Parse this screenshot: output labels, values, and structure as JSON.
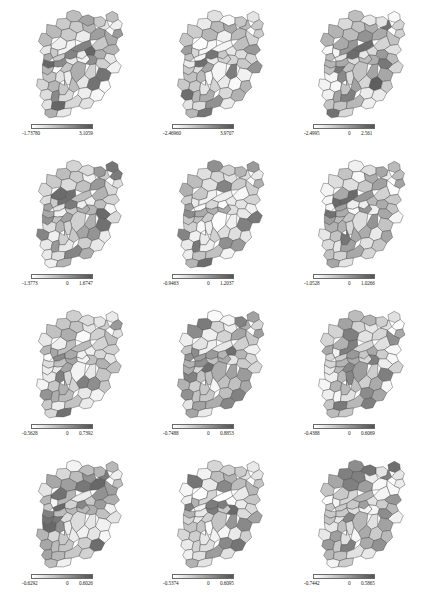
{
  "figure": {
    "type": "choropleth-grid",
    "rows": 4,
    "columns": 3,
    "background_color": "#ffffff",
    "region_outline_color": "#4d4d4d"
  },
  "chart_data": {
    "type": "heatmap",
    "title": "",
    "xlabel": "",
    "ylabel": "",
    "legend_position": "below-each-map",
    "grid": false,
    "colormap": {
      "name": "grayscale",
      "low_color": "#ffffff",
      "high_color": "#555555"
    },
    "panels": [
      {
        "index": 1,
        "row": 1,
        "column": 1,
        "legend": {
          "min": "-1.73780",
          "mid": "",
          "max": "3.1059"
        },
        "min_value": -1.7378,
        "mid_value": 0,
        "max_value": 3.1059
      },
      {
        "index": 2,
        "row": 1,
        "column": 2,
        "legend": {
          "min": "-2.46960",
          "mid": "",
          "max": "3.9707"
        },
        "min_value": -2.4696,
        "mid_value": 0,
        "max_value": 3.9707
      },
      {
        "index": 3,
        "row": 1,
        "column": 3,
        "legend": {
          "min": "-2.4995",
          "mid": "0",
          "max": "2.561"
        },
        "min_value": -2.4995,
        "mid_value": 0,
        "max_value": 2.561
      },
      {
        "index": 4,
        "row": 2,
        "column": 1,
        "legend": {
          "min": "-1.3773",
          "mid": "0",
          "max": "1.6747"
        },
        "min_value": -1.3773,
        "mid_value": 0,
        "max_value": 1.6747
      },
      {
        "index": 5,
        "row": 2,
        "column": 2,
        "legend": {
          "min": "-0.9463",
          "mid": "0",
          "max": "1.2037"
        },
        "min_value": -0.9463,
        "mid_value": 0,
        "max_value": 1.2037
      },
      {
        "index": 6,
        "row": 2,
        "column": 3,
        "legend": {
          "min": "-1.0528",
          "mid": "0",
          "max": "1.0266"
        },
        "min_value": -1.0528,
        "mid_value": 0,
        "max_value": 1.0266
      },
      {
        "index": 7,
        "row": 3,
        "column": 1,
        "legend": {
          "min": "-0.5628",
          "mid": "0",
          "max": "0.7392"
        },
        "min_value": -0.5628,
        "mid_value": 0,
        "max_value": 0.7392
      },
      {
        "index": 8,
        "row": 3,
        "column": 2,
        "legend": {
          "min": "-0.7488",
          "mid": "0",
          "max": "0.8853"
        },
        "min_value": -0.7488,
        "mid_value": 0,
        "max_value": 0.8853
      },
      {
        "index": 9,
        "row": 3,
        "column": 3,
        "legend": {
          "min": "-0.4388",
          "mid": "0",
          "max": "0.6069"
        },
        "min_value": -0.4388,
        "mid_value": 0,
        "max_value": 0.6069
      },
      {
        "index": 10,
        "row": 4,
        "column": 1,
        "legend": {
          "min": "-0.6292",
          "mid": "0",
          "max": "0.6026"
        },
        "min_value": -0.6292,
        "mid_value": 0,
        "max_value": 0.6026
      },
      {
        "index": 11,
        "row": 4,
        "column": 2,
        "legend": {
          "min": "-0.5374",
          "mid": "0",
          "max": "0.6095"
        },
        "min_value": -0.5374,
        "mid_value": 0,
        "max_value": 0.6095
      },
      {
        "index": 12,
        "row": 4,
        "column": 3,
        "legend": {
          "min": "-0.7442",
          "mid": "0",
          "max": "0.5865"
        },
        "min_value": -0.7442,
        "mid_value": 0,
        "max_value": 0.5865
      }
    ],
    "region_fill_levels": {
      "panel_1": [
        "#d8d8d8",
        "#c0c0c0",
        "#efefef",
        "#9a9a9a",
        "#e4e4e4",
        "#cfcfcf",
        "#b6b6b6",
        "#f3f3f3",
        "#8a8a8a",
        "#dcdcdc",
        "#c8c8c8",
        "#e8e8e8",
        "#a8a8a8",
        "#f0f0f0",
        "#d0d0d0",
        "#bdbdbd",
        "#666666",
        "#e0e0e0",
        "#cacaca",
        "#f5f5f5",
        "#9f9f9f",
        "#dadada",
        "#b0b0b0",
        "#ececec",
        "#c4c4c4",
        "#737373",
        "#e6e6e6",
        "#d4d4d4",
        "#aeaeae",
        "#f2f2f2",
        "#bababa",
        "#969696",
        "#e2e2e2",
        "#cdcdcd",
        "#848484",
        "#eeeeee",
        "#d6d6d6",
        "#c2c2c2",
        "#fafafa",
        "#a4a4a4",
        "#7e7e7e",
        "#dedede",
        "#b4b4b4",
        "#eaeaea",
        "#cbcbcb",
        "#9c9c9c",
        "#f7f7f7",
        "#d2d2d2",
        "#bebebe",
        "#8e8e8e",
        "#e7e7e7",
        "#c6c6c6",
        "#ababab"
      ],
      "panel_2": [
        "#e9e9e9",
        "#cccccc",
        "#f1f1f1",
        "#a6a6a6",
        "#d9d9d9",
        "#bbbbbb",
        "#efefef",
        "#919191",
        "#e2e2e2",
        "#c7c7c7",
        "#f6f6f6",
        "#b2b2b2",
        "#7d7d7d",
        "#dcdcdc",
        "#cfcfcf",
        "#ededed",
        "#9e9e9e",
        "#e5e5e5",
        "#c1c1c1",
        "#f9f9f9",
        "#888888",
        "#d4d4d4",
        "#b7b7b7",
        "#eaeaea",
        "#cacaca",
        "#6e6e6e",
        "#e0e0e0",
        "#d7d7d7",
        "#a9a9a9",
        "#f4f4f4",
        "#c4c4c4",
        "#999999",
        "#e6e6e6",
        "#d1d1d1",
        "#828282",
        "#f0f0f0",
        "#dadada",
        "#bfbfbf",
        "#fcfcfc",
        "#adadad",
        "#757575",
        "#e3e3e3",
        "#b9b9b9",
        "#ebebeb",
        "#c9c9c9",
        "#a1a1a1",
        "#f8f8f8",
        "#d5d5d5",
        "#c3c3c3",
        "#949494",
        "#e8e8e8",
        "#cdcdcd",
        "#b4b4b4"
      ],
      "panel_3": [
        "#dddddd",
        "#c5c5c5",
        "#f2f2f2",
        "#8f8f8f",
        "#e6e6e6",
        "#d0d0d0",
        "#b3b3b3",
        "#f7f7f7",
        "#787878",
        "#d7d7d7",
        "#c9c9c9",
        "#ececec",
        "#a2a2a2",
        "#f4f4f4",
        "#d3d3d3",
        "#bcbcbc",
        "#5f5f5f",
        "#e1e1e1",
        "#cbcbcb",
        "#fafafa",
        "#9b9b9b",
        "#dadada",
        "#aeaeae",
        "#efefef",
        "#c2c2c2",
        "#6c6c6c",
        "#e9e9e9",
        "#d5d5d5",
        "#a7a7a7",
        "#f5f5f5",
        "#b8b8b8",
        "#939393",
        "#e4e4e4",
        "#cecece",
        "#808080",
        "#f0f0f0",
        "#d9d9d9",
        "#c0c0c0",
        "#fdfdfd",
        "#a5a5a5",
        "#717171",
        "#e0e0e0",
        "#b5b5b5",
        "#ebebeb",
        "#c7c7c7",
        "#989898",
        "#f9f9f9",
        "#d1d1d1",
        "#bebebe",
        "#8a8a8a",
        "#e7e7e7",
        "#c4c4c4",
        "#aaaaaa"
      ],
      "panel_4": [
        "#cfcfcf",
        "#b5b5b5",
        "#eaeaea",
        "#8d8d8d",
        "#dfdfdf",
        "#c3c3c3",
        "#a6a6a6",
        "#f0f0f0",
        "#7f7f7f",
        "#d5d5d5",
        "#bdbdbd",
        "#e5e5e5",
        "#999999",
        "#eeeeee",
        "#cacaca",
        "#b0b0b0",
        "#6b6b6b",
        "#dbdbdb",
        "#c6c6c6",
        "#f4f4f4",
        "#949494",
        "#d2d2d2",
        "#a9a9a9",
        "#e8e8e8",
        "#bfbfbf",
        "#757575",
        "#e2e2e2",
        "#d0d0d0",
        "#a1a1a1",
        "#f2f2f2",
        "#b3b3b3",
        "#8a8a8a",
        "#dddddd",
        "#c8c8c8",
        "#7b7b7b",
        "#ececec",
        "#d4d4d4",
        "#babababa",
        "#f8f8f8",
        "#9e9e9e",
        "#707070",
        "#d9d9d9",
        "#aeaeae",
        "#e6e6e6",
        "#c1c1c1",
        "#929292",
        "#f6f6f6",
        "#cccccc",
        "#b8b8b8",
        "#858585",
        "#e3e3e3",
        "#bebebe",
        "#a4a4a4"
      ],
      "panel_5": [
        "#e3e3e3",
        "#cacaca",
        "#f3f3f3",
        "#a0a0a0",
        "#d6d6d6",
        "#bababa",
        "#eeeeee",
        "#8c8c8c",
        "#dfdfdf",
        "#c5c5c5",
        "#f8f8f8",
        "#b0b0b0",
        "#787878",
        "#dadada",
        "#cecece",
        "#ebebeb",
        "#9a9a9a",
        "#e7e7e7",
        "#c0c0c0",
        "#fbfbfb",
        "#848484",
        "#d1d1d1",
        "#b5b5b5",
        "#e9e9e9",
        "#c8c8c8",
        "#6d6d6d",
        "#dddddd",
        "#d4d4d4",
        "#a7a7a7",
        "#f1f1f1",
        "#c3c3c3",
        "#959595",
        "#e5e5e5",
        "#cfcfcf",
        "#808080",
        "#efefef",
        "#d8d8d8",
        "#bdbdbd",
        "#fdfdfd",
        "#ababab",
        "#737373",
        "#e1e1e1",
        "#b7b7b7",
        "#eaeaea",
        "#c7c7c7",
        "#9f9f9f",
        "#f7f7f7",
        "#d3d3d3",
        "#c1c1c1",
        "#909090",
        "#e6e6e6",
        "#cbcbcb",
        "#b2b2b2"
      ],
      "panel_6": [
        "#dadada",
        "#c2c2c2",
        "#f0f0f0",
        "#979797",
        "#e4e4e4",
        "#cdcdcd",
        "#b1b1b1",
        "#f5f5f5",
        "#828282",
        "#d4d4d4",
        "#c6c6c6",
        "#eaeaea",
        "#a4a4a4",
        "#f2f2f2",
        "#d1d1d1",
        "#b9b9b9",
        "#6a6a6a",
        "#dfdfdf",
        "#c9c9c9",
        "#f9f9f9",
        "#9d9d9d",
        "#d7d7d7",
        "#acacac",
        "#ededed",
        "#bfbfbf",
        "#767676",
        "#e7e7e7",
        "#d3d3d3",
        "#a9a9a9",
        "#f4f4f4",
        "#b6b6b6",
        "#8f8f8f",
        "#e2e2e2",
        "#cbcbcb",
        "#7c7c7c",
        "#eeeeee",
        "#d6d6d6",
        "#bdbdbd",
        "#fcfcfc",
        "#a1a1a1",
        "#717171",
        "#dedede",
        "#b3b3b3",
        "#e9e9e9",
        "#c4c4c4",
        "#949494",
        "#f8f8f8",
        "#cfcfcf",
        "#bbbbbb",
        "#888888",
        "#e5e5e5",
        "#c1c1c1",
        "#a7a7a7"
      ],
      "panel_7": [
        "#d3d3d3",
        "#bcbcbc",
        "#efefef",
        "#949494",
        "#e1e1e1",
        "#c7c7c7",
        "#aaaaaa",
        "#f4f4f4",
        "#858585",
        "#d8d8d8",
        "#c0c0c0",
        "#e7e7e7",
        "#9e9e9e",
        "#f1f1f1",
        "#cecece",
        "#b4b4b4",
        "#707070",
        "#dddddd",
        "#c9c9c9",
        "#f7f7f7",
        "#9a9a9a",
        "#d5d5d5",
        "#aeaeae",
        "#eaeaea",
        "#c3c3c3",
        "#7a7a7a",
        "#e5e5e5",
        "#d1d1d1",
        "#a5a5a5",
        "#f3f3f3",
        "#b7b7b7",
        "#8e8e8e",
        "#e0e0e0",
        "#cbcbcb",
        "#808080",
        "#ededed",
        "#d7d7d7",
        "#bebebe",
        "#fafafa",
        "#a2a2a2",
        "#757575",
        "#dbdbdb",
        "#b1b1b1",
        "#e8e8e8",
        "#c5c5c5",
        "#989898",
        "#f6f6f6",
        "#d0d0d0",
        "#bababa",
        "#8a8a8a",
        "#e3e3e3",
        "#c2c2c2",
        "#a8a8a8"
      ],
      "panel_8": [
        "#dededede",
        "#c4c4c4",
        "#f1f1f1",
        "#9b9b9b",
        "#e5e5e5",
        "#cfcfcf",
        "#b2b2b2",
        "#f6f6f6",
        "#878787",
        "#d9d9d9",
        "#c8c8c8",
        "#ebebeb",
        "#a5a5a5",
        "#f3f3f3",
        "#d2d2d2",
        "#bababa",
        "#6f6f6f",
        "#e0e0e0",
        "#cacaca",
        "#fafafa",
        "#9f9f9f",
        "#d6d6d6",
        "#adadad",
        "#eeeeee",
        "#c1c1c1",
        "#7b7b7b",
        "#e8e8e8",
        "#d4d4d4",
        "#a8a8a8",
        "#f5f5f5",
        "#b5b5b5",
        "#919191",
        "#e3e3e3",
        "#cccccc",
        "#828282",
        "#efefef",
        "#d7d7d7",
        "#bfbfbf",
        "#fdfdfd",
        "#a2a2a2",
        "#767676",
        "#dfdfdf",
        "#b4b4b4",
        "#eaeaea",
        "#c6c6c6",
        "#969696",
        "#f9f9f9",
        "#d0d0d0",
        "#bdbdbd",
        "#8c8c8c",
        "#e6e6e6",
        "#c3c3c3",
        "#aaaaaa"
      ],
      "panel_9": [
        "#d7d7d7",
        "#c1c1c1",
        "#eeeeee",
        "#9d9d9d",
        "#e3e3e3",
        "#cbcbcb",
        "#b0b0b0",
        "#f5f5f5",
        "#8b8b8b",
        "#d5d5d5",
        "#c5c5c5",
        "#e9e9e9",
        "#a3a3a3",
        "#f2f2f2",
        "#d0d0d0",
        "#b8b8b8",
        "#747474",
        "#dddddd",
        "#c7c7c7",
        "#f8f8f8",
        "#999999",
        "#d3d3d3",
        "#ababab",
        "#ececec",
        "#bebebe",
        "#7f7f7f",
        "#e6e6e6",
        "#d2d2d2",
        "#a6a6a6",
        "#f4f4f4",
        "#b4b4b4",
        "#929292",
        "#e1e1e1",
        "#c9c9c9",
        "#868686",
        "#efefef",
        "#d6d6d6",
        "#bcbcbc",
        "#fbfbfb",
        "#a0a0a0",
        "#7a7a7a",
        "#dbdbdb",
        "#b2b2b2",
        "#e8e8e8",
        "#c3c3c3",
        "#959595",
        "#f7f7f7",
        "#cecece",
        "#b9b9b9",
        "#909090",
        "#e4e4e4",
        "#c0c0c0",
        "#a9a9a9"
      ],
      "panel_10": [
        "#cdcdcd",
        "#b3b3b3",
        "#e9e9e9",
        "#8b8b8b",
        "#dedede",
        "#c1c1c1",
        "#a4a4a4",
        "#f0f0f0",
        "#7c7c7c",
        "#d4d4d4",
        "#bbbbbb",
        "#e4e4e4",
        "#979797",
        "#ededed",
        "#c9c9c9",
        "#aeaeae",
        "#686868",
        "#dadada",
        "#c4c4c4",
        "#f3f3f3",
        "#929292",
        "#d0d0d0",
        "#a7a7a7",
        "#e7e7e7",
        "#bdbdbd",
        "#727272",
        "#e1e1e1",
        "#cfcfcf",
        "#9f9f9f",
        "#f1f1f1",
        "#b1b1b1",
        "#878787",
        "#dcdcdc",
        "#c6c6c6",
        "#787878",
        "#ebebeb",
        "#d3d3d3",
        "#b8b8b8",
        "#f7f7f7",
        "#9c9c9c",
        "#6d6d6d",
        "#d8d8d8",
        "#acacac",
        "#e5e5e5",
        "#bfbfbf",
        "#8f8f8f",
        "#f5f5f5",
        "#cbcbcb",
        "#b6b6b6",
        "#828282",
        "#e2e2e2",
        "#bcbcbc",
        "#a2a2a2"
      ],
      "panel_11": [
        "#e0e0e0",
        "#c6c6c6",
        "#f2f2f2",
        "#9c9c9c",
        "#d4d4d4",
        "#b7b7b7",
        "#ededed",
        "#898989",
        "#dcdcdc",
        "#c2c2c2",
        "#f7f7f7",
        "#adadad",
        "#757575",
        "#d8d8d8",
        "#cbcbcb",
        "#eaeaea",
        "#969696",
        "#e4e4e4",
        "#bdbdbd",
        "#fafafa",
        "#818181",
        "#cfcfcf",
        "#b2b2b2",
        "#e8e8e8",
        "#c5c5c5",
        "#6a6a6a",
        "#dadada",
        "#d1d1d1",
        "#a4a4a4",
        "#f0f0f0",
        "#c0c0c0",
        "#919191",
        "#e2e2e2",
        "#cccccc",
        "#7d7d7d",
        "#eeeeee",
        "#d6d6d6",
        "#babababa",
        "#fcfcfc",
        "#a8a8a8",
        "#707070",
        "#dfdfdf",
        "#b4b4b4",
        "#e9e9e9",
        "#c4c4c4",
        "#9b9b9b",
        "#f6f6f6",
        "#d0d0d0",
        "#bebebe",
        "#8d8d8d",
        "#e5e5e5",
        "#c8c8c8",
        "#afafaf"
      ],
      "panel_12": [
        "#d9d9d9",
        "#c0c0c0",
        "#efefef",
        "#969696",
        "#e2e2e2",
        "#cbcbcb",
        "#afafaf",
        "#f4f4f4",
        "#808080",
        "#d3d3d3",
        "#c4c4c4",
        "#e8e8e8",
        "#a2a2a2",
        "#f1f1f1",
        "#cfcfcf",
        "#b7b7b7",
        "#686868",
        "#dedede",
        "#c7c7c7",
        "#f8f8f8",
        "#9b9b9b",
        "#d6d6d6",
        "#aaaaaa",
        "#ececec",
        "#bdbdbd",
        "#747474",
        "#e6e6e6",
        "#d1d1d1",
        "#a7a7a7",
        "#f3f3f3",
        "#b4b4b4",
        "#8d8d8d",
        "#e1e1e1",
        "#c9c9c9",
        "#7a7a7a",
        "#ededed",
        "#d5d5d5",
        "#bbbbbb",
        "#fbfbfb",
        "#9f9f9f",
        "#6f6f6f",
        "#dcdcdc",
        "#b1b1b1",
        "#e7e7e7",
        "#c2c2c2",
        "#929292",
        "#f7f7f7",
        "#cdcdcd",
        "#b9b9b9",
        "#868686",
        "#e4e4e4",
        "#bfbfbf",
        "#a5a5a5"
      ]
    }
  }
}
